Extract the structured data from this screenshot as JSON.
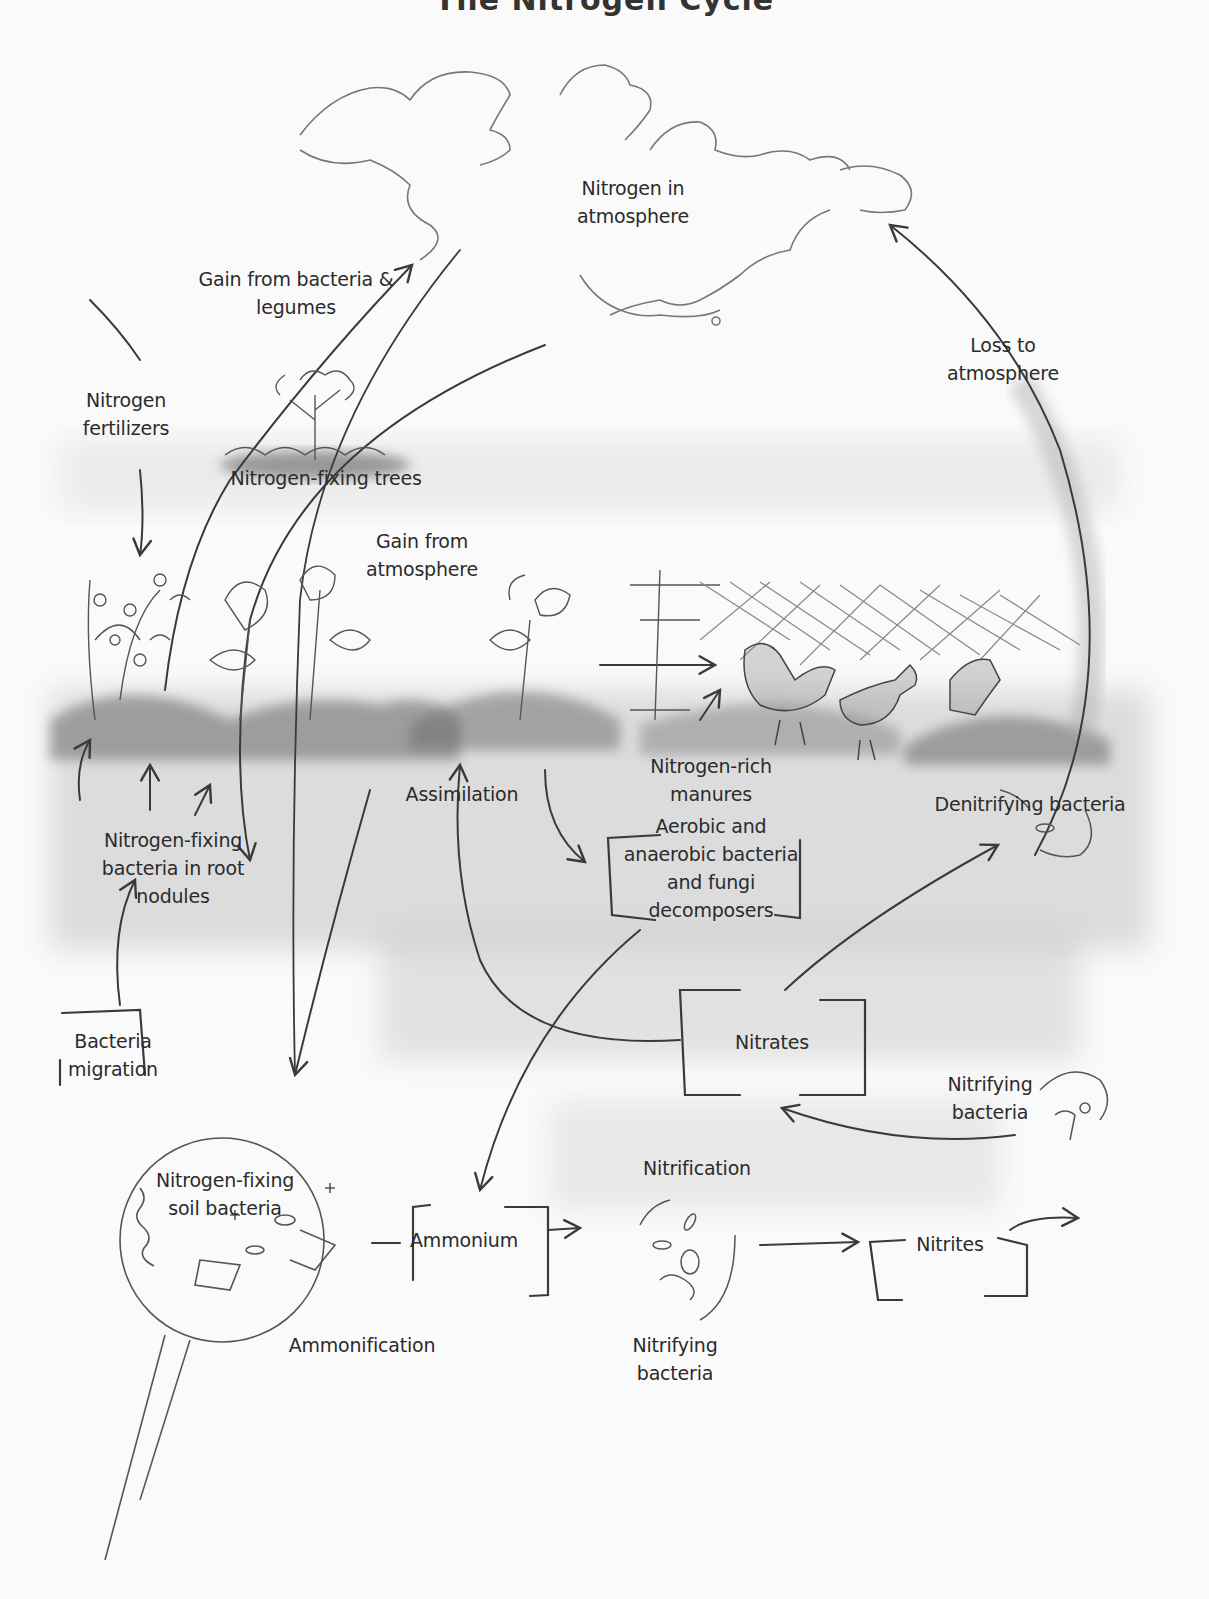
{
  "title": "The Nitrogen Cycle",
  "colors": {
    "paper": "#fafafa",
    "pencil": "#3a3a3a",
    "soil_shade": "#9a9a9a",
    "text": "#2b2b2b"
  },
  "labels": {
    "atmosphere": [
      "Nitrogen in",
      "atmosphere"
    ],
    "gain_bacteria_legumes": [
      "Gain from bacteria &",
      "legumes"
    ],
    "nitrogen_fertilizers": [
      "Nitrogen",
      "fertilizers"
    ],
    "nitrogen_fixing_trees": [
      "Nitrogen-fixing trees"
    ],
    "gain_from_atmosphere": [
      "Gain from",
      "atmosphere"
    ],
    "loss_to_atmosphere": [
      "Loss to",
      "atmosphere"
    ],
    "nitrogen_rich_manures": [
      "Nitrogen-rich",
      "manures"
    ],
    "assimilation": [
      "Assimilation"
    ],
    "denitrifying_bacteria": [
      "Denitrifying bacteria"
    ],
    "root_nodule_bacteria": [
      "Nitrogen-fixing",
      "bacteria in root",
      "nodules"
    ],
    "decomposers": [
      "Aerobic and",
      "anaerobic bacteria",
      "and fungi",
      "decomposers"
    ],
    "bacteria_migration": [
      "Bacteria",
      "migration"
    ],
    "nitrates": [
      "Nitrates"
    ],
    "nitrifying_bacteria_upper": [
      "Nitrifying",
      "bacteria"
    ],
    "soil_bacteria": [
      "Nitrogen-fixing",
      "soil bacteria"
    ],
    "ammonium": [
      "Ammonium"
    ],
    "nitrification": [
      "Nitrification"
    ],
    "nitrites": [
      "Nitrites"
    ],
    "ammonification": [
      "Ammonification"
    ],
    "nitrifying_bacteria_lower": [
      "Nitrifying",
      "bacteria"
    ]
  }
}
